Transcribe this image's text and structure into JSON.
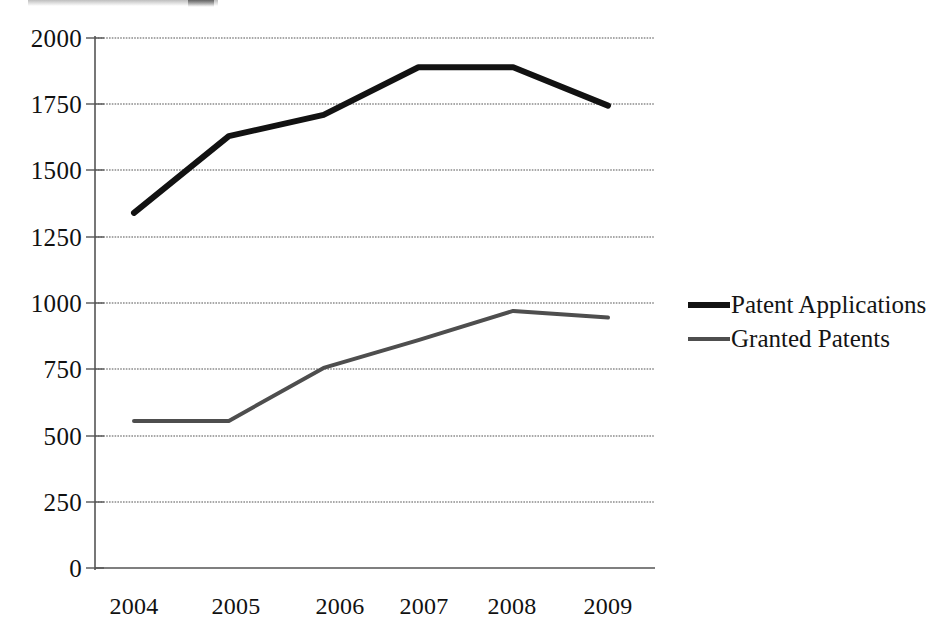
{
  "chart_data": {
    "type": "line",
    "title": "",
    "subtitle": "",
    "xlabel": "",
    "ylabel": "",
    "categories": [
      "2004",
      "2005",
      "2006",
      "2007",
      "2008",
      "2009"
    ],
    "x": [
      2004,
      2005,
      2006,
      2007,
      2008,
      2009
    ],
    "series": [
      {
        "name": "Patent Applications",
        "values": [
          1340,
          1630,
          1710,
          1890,
          1890,
          1745
        ],
        "color": "#121212",
        "line_width": 6
      },
      {
        "name": "Granted Patents",
        "values": [
          555,
          555,
          755,
          860,
          970,
          945
        ],
        "color": "#4e4e4e",
        "line_width": 4
      }
    ],
    "ylim": [
      0,
      2000
    ],
    "yticks": [
      0,
      250,
      500,
      750,
      1000,
      1250,
      1500,
      1750,
      2000
    ],
    "ytick_labels": [
      "0",
      "250",
      "500",
      "750",
      "1000",
      "1250",
      "1500",
      "1750",
      "2000"
    ],
    "xtick_labels": [
      "2004",
      "2005",
      "2006",
      "2007",
      "2008",
      "2009"
    ],
    "grid": true,
    "grid_axis": "y",
    "grid_color": "#8c8c8c",
    "legend_position": "right",
    "legend_entries": [
      "Patent Applications",
      "Granted Patents"
    ],
    "annotations": []
  },
  "axis": {
    "axis_color": "#555555"
  }
}
